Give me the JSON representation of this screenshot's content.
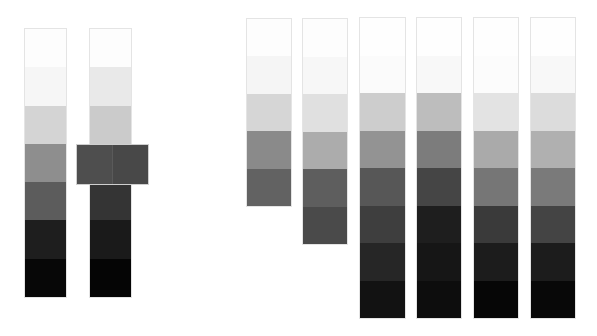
{
  "strips": [
    {
      "id": "strip-1",
      "x": 25,
      "y": 29,
      "w": 41,
      "h": 268,
      "blocks": [
        "#fdfdfd",
        "#f6f6f6",
        "#d4d4d4",
        "#8e8e8e",
        "#5c5c5c",
        "#1e1e1e",
        "#070707"
      ]
    },
    {
      "id": "strip-2",
      "x": 90,
      "y": 29,
      "w": 41,
      "h": 268,
      "blocks": [
        "#fdfdfd",
        "#e9e9e9",
        "#cbcbcb",
        "#5a5a5a",
        "#343434",
        "#1a1a1a",
        "#050505"
      ]
    },
    {
      "id": "strip-3",
      "x": 247,
      "y": 19,
      "w": 44,
      "h": 187,
      "blocks": [
        "#fdfdfd",
        "#f5f5f5",
        "#d6d6d6",
        "#8a8a8a",
        "#626262"
      ]
    },
    {
      "id": "strip-4",
      "x": 303,
      "y": 19,
      "w": 44,
      "h": 225,
      "blocks": [
        "#fdfdfd",
        "#f7f7f7",
        "#e0e0e0",
        "#acacac",
        "#5e5e5e",
        "#4a4a4a"
      ]
    },
    {
      "id": "strip-5",
      "x": 360,
      "y": 18,
      "w": 45,
      "h": 300,
      "blocks": [
        "#fefefe",
        "#fbfbfb",
        "#cdcdcd",
        "#939393",
        "#575757",
        "#3e3e3e",
        "#262626",
        "#121212"
      ]
    },
    {
      "id": "strip-6",
      "x": 417,
      "y": 18,
      "w": 44,
      "h": 300,
      "blocks": [
        "#fefefe",
        "#f8f8f8",
        "#bdbdbd",
        "#7c7c7c",
        "#454545",
        "#1e1e1e",
        "#161616",
        "#0d0d0d"
      ]
    },
    {
      "id": "strip-7",
      "x": 474,
      "y": 18,
      "w": 44,
      "h": 300,
      "blocks": [
        "#fefefe",
        "#fcfcfc",
        "#e3e3e3",
        "#aaaaaa",
        "#767676",
        "#3a3a3a",
        "#1c1c1c",
        "#060606"
      ]
    },
    {
      "id": "strip-8",
      "x": 531,
      "y": 18,
      "w": 44,
      "h": 300,
      "blocks": [
        "#fefefe",
        "#f8f8f8",
        "#dcdcdc",
        "#b0b0b0",
        "#7a7a7a",
        "#444444",
        "#1c1c1c",
        "#080808"
      ]
    }
  ],
  "overlay": {
    "x": 77,
    "y": 145,
    "w": 71,
    "h": 39,
    "halves": [
      "#4e4e4e",
      "#484848"
    ]
  }
}
